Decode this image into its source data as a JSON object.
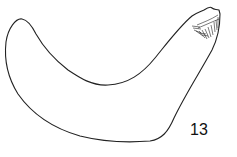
{
  "figure": {
    "label": "13",
    "stroke_color": "#222222",
    "background": "#ffffff"
  }
}
